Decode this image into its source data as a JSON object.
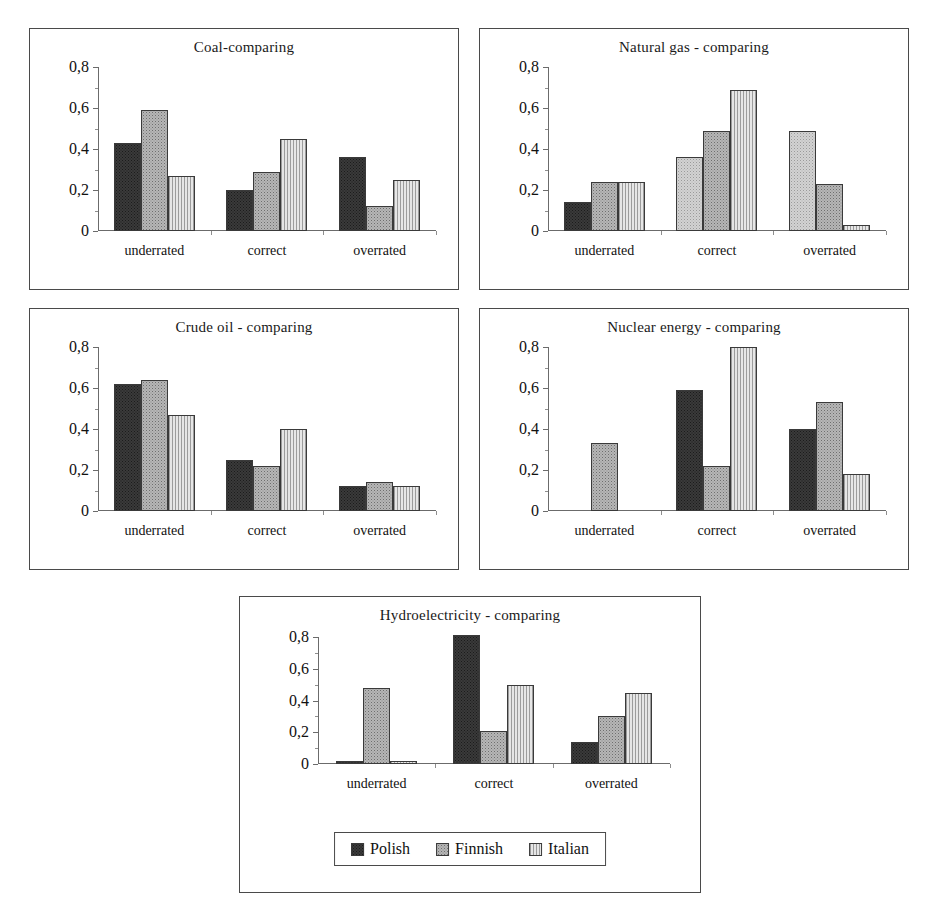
{
  "figure": {
    "caption": "",
    "y_axis": {
      "ticks": [
        "0,8",
        "0,6",
        "0,4",
        "0,2",
        "0"
      ],
      "tick_values": [
        0.8,
        0.6,
        0.4,
        0.2,
        0
      ],
      "min": 0,
      "max": 0.8
    },
    "categories": [
      "underrated",
      "correct",
      "overrated"
    ],
    "legend": {
      "items": [
        {
          "label": "Polish",
          "pattern": "solid-dark",
          "color": "#3a3a3a"
        },
        {
          "label": "Finnish",
          "pattern": "dotted-gray",
          "color": "#b6b6b6"
        },
        {
          "label": "Italian",
          "pattern": "vertical-lines",
          "color": "#dcdcdc"
        }
      ]
    }
  },
  "chart_data": [
    {
      "type": "bar",
      "title": "Coal-comparing",
      "xlabel": "",
      "ylabel": "",
      "ylim": [
        0,
        0.8
      ],
      "yticks": [
        0,
        0.2,
        0.4,
        0.6,
        0.8
      ],
      "categories": [
        "underrated",
        "correct",
        "overrated"
      ],
      "series": [
        {
          "name": "Polish",
          "values": [
            0.43,
            0.2,
            0.36
          ]
        },
        {
          "name": "Finnish",
          "values": [
            0.59,
            0.29,
            0.12
          ]
        },
        {
          "name": "Italian",
          "values": [
            0.27,
            0.45,
            0.25
          ]
        }
      ],
      "grid": false,
      "legend_position": "none"
    },
    {
      "type": "bar",
      "title": "Natural gas - comparing",
      "xlabel": "",
      "ylabel": "",
      "ylim": [
        0,
        0.8
      ],
      "yticks": [
        0,
        0.2,
        0.4,
        0.6,
        0.8
      ],
      "categories": [
        "underrated",
        "correct",
        "overrated"
      ],
      "series": [
        {
          "name": "Polish",
          "values": [
            0.14,
            0.36,
            0.49
          ]
        },
        {
          "name": "Finnish",
          "values": [
            0.24,
            0.49,
            0.23
          ]
        },
        {
          "name": "Italian",
          "values": [
            0.24,
            0.69,
            0.03
          ]
        }
      ],
      "grid": false,
      "legend_position": "none"
    },
    {
      "type": "bar",
      "title": "Crude oil - comparing",
      "xlabel": "",
      "ylabel": "",
      "ylim": [
        0,
        0.8
      ],
      "yticks": [
        0,
        0.2,
        0.4,
        0.6,
        0.8
      ],
      "categories": [
        "underrated",
        "correct",
        "overrated"
      ],
      "series": [
        {
          "name": "Polish",
          "values": [
            0.62,
            0.25,
            0.12
          ]
        },
        {
          "name": "Finnish",
          "values": [
            0.64,
            0.22,
            0.14
          ]
        },
        {
          "name": "Italian",
          "values": [
            0.47,
            0.4,
            0.12
          ]
        }
      ],
      "grid": false,
      "legend_position": "none"
    },
    {
      "type": "bar",
      "title": "Nuclear energy - comparing",
      "xlabel": "",
      "ylabel": "",
      "ylim": [
        0,
        0.8
      ],
      "yticks": [
        0,
        0.2,
        0.4,
        0.6,
        0.8
      ],
      "categories": [
        "underrated",
        "correct",
        "overrated"
      ],
      "series": [
        {
          "name": "Polish",
          "values": [
            0.0,
            0.59,
            0.4
          ]
        },
        {
          "name": "Finnish",
          "values": [
            0.33,
            0.22,
            0.53
          ]
        },
        {
          "name": "Italian",
          "values": [
            0.0,
            0.8,
            0.18
          ]
        }
      ],
      "grid": false,
      "legend_position": "none"
    },
    {
      "type": "bar",
      "title": "Hydroelectricity - comparing",
      "xlabel": "",
      "ylabel": "",
      "ylim": [
        0,
        0.8
      ],
      "yticks": [
        0,
        0.2,
        0.4,
        0.6,
        0.8
      ],
      "categories": [
        "underrated",
        "correct",
        "overrated"
      ],
      "series": [
        {
          "name": "Polish",
          "values": [
            0.02,
            0.81,
            0.14
          ]
        },
        {
          "name": "Finnish",
          "values": [
            0.48,
            0.21,
            0.3
          ]
        },
        {
          "name": "Italian",
          "values": [
            0.02,
            0.5,
            0.45
          ]
        }
      ],
      "grid": false,
      "legend_position": "bottom-center"
    }
  ]
}
